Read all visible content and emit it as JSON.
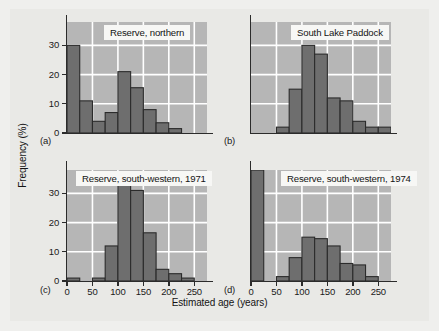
{
  "figure": {
    "axis_title_x": "Estimated age (years)",
    "axis_title_y": "Frequency (%)",
    "background_color": "#efefed",
    "plot_background_color": "#b6b6b6",
    "bar_color": "#6e6e6e",
    "gridline_color": "#ffffff",
    "axis_color": "#2b2b2b"
  },
  "panels": {
    "a": {
      "letter": "(a)",
      "title": "Reserve, northern",
      "y_ticks": [
        "0",
        "10",
        "20",
        "30"
      ],
      "x_ticks": []
    },
    "b": {
      "letter": "(b)",
      "title": "South Lake Paddock",
      "y_ticks": [],
      "x_ticks": []
    },
    "c": {
      "letter": "(c)",
      "title": "Reserve, south-western, 1971",
      "y_ticks": [
        "0",
        "10",
        "20",
        "30"
      ],
      "x_ticks": [
        "0",
        "50",
        "100",
        "150",
        "200",
        "250"
      ]
    },
    "d": {
      "letter": "(d)",
      "title": "Reserve, south-western, 1974",
      "y_ticks": [],
      "x_ticks": [
        "0",
        "50",
        "100",
        "150",
        "200",
        "250"
      ]
    }
  },
  "chart_data": [
    {
      "type": "bar",
      "id": "a",
      "title": "Reserve, northern",
      "xlabel": "Estimated age (years)",
      "ylabel": "Frequency (%)",
      "bin_width": 25,
      "bin_starts": [
        0,
        25,
        50,
        75,
        100,
        125,
        150,
        175,
        200,
        225
      ],
      "categories": [
        "0-25",
        "25-50",
        "50-75",
        "75-100",
        "100-125",
        "125-150",
        "150-175",
        "175-200",
        "200-225",
        "225-250"
      ],
      "values": [
        30,
        11,
        4,
        7,
        21,
        15.5,
        8,
        3.5,
        1.5,
        0
      ],
      "xlim": [
        0,
        275
      ],
      "ylim": [
        0,
        38
      ],
      "y_tick_values": [
        0,
        10,
        20,
        30
      ],
      "x_tick_values": [
        0,
        50,
        100,
        150,
        200,
        250
      ],
      "grid": true
    },
    {
      "type": "bar",
      "id": "b",
      "title": "South Lake Paddock",
      "xlabel": "Estimated age (years)",
      "ylabel": "Frequency (%)",
      "bin_width": 25,
      "bin_starts": [
        0,
        25,
        50,
        75,
        100,
        125,
        150,
        175,
        200,
        225,
        250
      ],
      "categories": [
        "0-25",
        "25-50",
        "50-75",
        "75-100",
        "100-125",
        "125-150",
        "150-175",
        "175-200",
        "200-225",
        "225-250",
        "250-275"
      ],
      "values": [
        0,
        0,
        2,
        15,
        30,
        27,
        12,
        11,
        4,
        2,
        2
      ],
      "xlim": [
        0,
        275
      ],
      "ylim": [
        0,
        38
      ],
      "y_tick_values": [
        0,
        10,
        20,
        30
      ],
      "x_tick_values": [
        0,
        50,
        100,
        150,
        200,
        250
      ],
      "grid": true
    },
    {
      "type": "bar",
      "id": "c",
      "title": "Reserve, south-western, 1971",
      "xlabel": "Estimated age (years)",
      "ylabel": "Frequency (%)",
      "bin_width": 25,
      "bin_starts": [
        0,
        25,
        50,
        75,
        100,
        125,
        150,
        175,
        200,
        225
      ],
      "categories": [
        "0-25",
        "25-50",
        "50-75",
        "75-100",
        "100-125",
        "125-150",
        "150-175",
        "175-200",
        "200-225",
        "225-250"
      ],
      "values": [
        1,
        0,
        1,
        12,
        33.5,
        31,
        16.5,
        4,
        2.5,
        1
      ],
      "xlim": [
        0,
        275
      ],
      "ylim": [
        0,
        38
      ],
      "y_tick_values": [
        0,
        10,
        20,
        30
      ],
      "x_tick_values": [
        0,
        50,
        100,
        150,
        200,
        250
      ],
      "grid": true
    },
    {
      "type": "bar",
      "id": "d",
      "title": "Reserve, south-western, 1974",
      "xlabel": "Estimated age (years)",
      "ylabel": "Frequency (%)",
      "bin_width": 25,
      "bin_starts": [
        0,
        25,
        50,
        75,
        100,
        125,
        150,
        175,
        200,
        225
      ],
      "categories": [
        "0-25",
        "25-50",
        "50-75",
        "75-100",
        "100-125",
        "125-150",
        "150-175",
        "175-200",
        "200-225",
        "225-250"
      ],
      "values": [
        40,
        0,
        1.5,
        8,
        15,
        14.5,
        12,
        6,
        5.5,
        1.5
      ],
      "note": "first bar exceeds plot top (truncated)",
      "xlim": [
        0,
        275
      ],
      "ylim": [
        0,
        38
      ],
      "y_tick_values": [
        0,
        10,
        20,
        30
      ],
      "x_tick_values": [
        0,
        50,
        100,
        150,
        200,
        250
      ],
      "grid": true
    }
  ]
}
